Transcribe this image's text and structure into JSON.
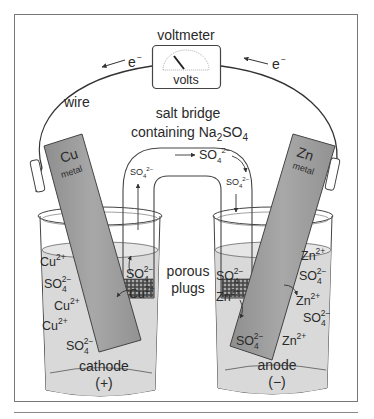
{
  "figure": {
    "labels": {
      "voltmeter": "voltmeter",
      "volts": "volts",
      "wire": "wire",
      "electron_left": "e",
      "electron_right": "e",
      "electron_charge": "−",
      "salt_bridge_line1": "salt bridge",
      "salt_bridge_line2_prefix": "containing Na",
      "salt_bridge_line2_sub1": "2",
      "salt_bridge_line2_mid": "SO",
      "salt_bridge_line2_sub2": "4",
      "porous_line1": "porous",
      "porous_line2": "plugs",
      "cu_symbol": "Cu",
      "cu_metal": "metal",
      "zn_symbol": "Zn",
      "zn_metal": "metal",
      "cathode": "cathode",
      "cathode_sign": "(+)",
      "anode": "anode",
      "anode_sign": "(−)"
    },
    "ion_text": {
      "cu": "Cu",
      "zn": "Zn",
      "so": "SO",
      "sub4": "4",
      "charge_2plus": "2+",
      "charge_2minus": "2−"
    },
    "cathode_beaker_ions": [
      "Cu2+",
      "SO4 2-",
      "Cu2+",
      "Cu2+",
      "SO4 2-",
      "SO4 2-",
      "Cu2+"
    ],
    "anode_beaker_ions": [
      "Zn2+",
      "SO4 2-",
      "SO4 2-",
      "Zn2+",
      "Zn2+",
      "SO4 2-",
      "SO4 2-",
      "Zn2+"
    ],
    "salt_bridge_ions": [
      "SO4 2- (left arm, moving up)",
      "SO4 2- (top, moving left)",
      "SO4 2- (right arm, moving down)"
    ],
    "colors": {
      "metal_strip": "#9a9a9a",
      "solution": "#d9d9d9",
      "outline": "#3a3a3a",
      "frame": "#555555"
    }
  }
}
